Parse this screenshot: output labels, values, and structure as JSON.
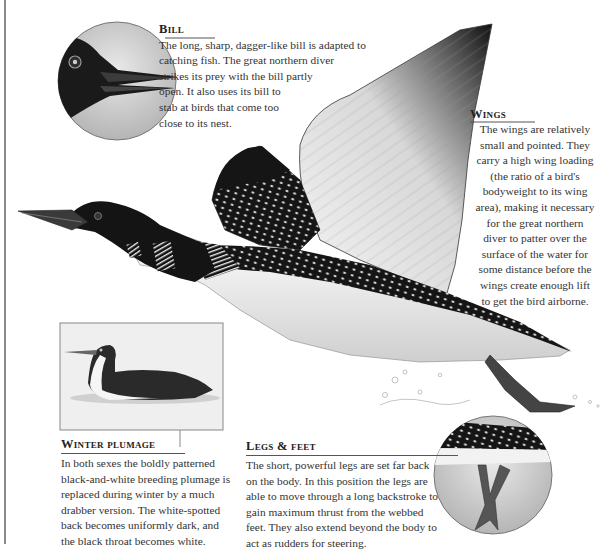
{
  "page": {
    "accent_colors": {
      "rule": "#8a8a8a",
      "heading": "#222222",
      "body_text": "#333333"
    }
  },
  "illustrations": [
    {
      "id": "main",
      "label": "Great northern diver in flight"
    },
    {
      "id": "bill_inset",
      "label": "Close-up of bill"
    },
    {
      "id": "winter_inset",
      "label": "Diver in winter plumage on water"
    },
    {
      "id": "legs_inset",
      "label": "Legs and feet underwater"
    }
  ],
  "sections": {
    "bill": {
      "heading": "Bill",
      "text": "The long, sharp, dagger-like bill is adapted to\ncatching fish. The great northern diver\nstrikes its prey with the bill partly\nopen. It also uses its bill to\nstab at birds that come too\nclose to its nest."
    },
    "wings": {
      "heading": "Wings",
      "text": "The wings are relatively\nsmall and pointed. They\ncarry a high wing loading\n(the ratio of a bird's\nbodyweight to its wing\narea), making it necessary\nfor the great northern\ndiver to patter over the\nsurface of the water for\nsome distance before the\nwings create enough lift\nto get the bird airborne."
    },
    "winter_plumage": {
      "heading": "Winter plumage",
      "text": "In both sexes the boldly patterned\nblack-and-white breeding plumage is\nreplaced during winter by a much\ndrabber version. The white-spotted\nback becomes uniformly dark, and\nthe black throat becomes white."
    },
    "legs_feet": {
      "heading": "Legs & feet",
      "text": "The short, powerful legs are set far back\non the body. In this position the legs are\nable to move through a long backstroke to\ngain maximum thrust from the webbed\nfeet. They also extend beyond the body to\nact as rudders for steering."
    }
  }
}
